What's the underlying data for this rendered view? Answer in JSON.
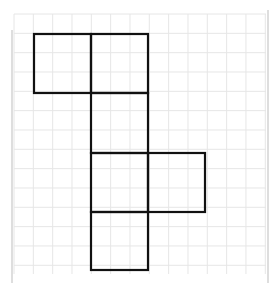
{
  "diagram": {
    "type": "cube-net-on-grid",
    "grid": {
      "x0": 14,
      "y0": 14,
      "x1": 266,
      "y1": 274,
      "cell": 19.33,
      "line_color": "#e6e6e6",
      "border_color": "#bdbdbd",
      "border_left_x": 12,
      "border_right_x": 268,
      "border_top_y": 10,
      "border_bottom_y": 283
    },
    "shape": {
      "stroke": "#111111",
      "stroke_width": 2.2,
      "squares": [
        {
          "id": "A",
          "x": 34,
          "y": 34,
          "w": 57,
          "h": 59
        },
        {
          "id": "B",
          "x": 91,
          "y": 34,
          "w": 57,
          "h": 59
        },
        {
          "id": "C",
          "x": 91,
          "y": 93,
          "w": 57,
          "h": 60
        },
        {
          "id": "D",
          "x": 91,
          "y": 153,
          "w": 57,
          "h": 59
        },
        {
          "id": "E",
          "x": 148,
          "y": 153,
          "w": 57,
          "h": 59
        },
        {
          "id": "F",
          "x": 91,
          "y": 212,
          "w": 57,
          "h": 58
        }
      ]
    }
  }
}
